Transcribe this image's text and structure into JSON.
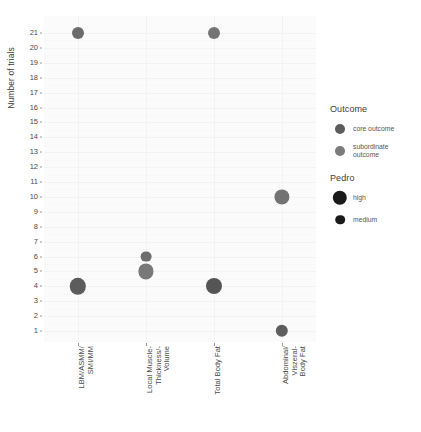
{
  "chart_data": {
    "type": "scatter",
    "title": "",
    "xlabel": "",
    "ylabel": "Number of trials",
    "ylim": [
      1,
      21
    ],
    "grid": true,
    "legend_position": "right",
    "categories": [
      "LBM/ASMM/\nSMI/MM",
      "Local Muscle-\nThickness/-\nVolume",
      "Total Body Fat",
      "Abdominal/\nViszeral-\nBody Fat"
    ],
    "y_ticks": [
      1,
      2,
      3,
      4,
      5,
      6,
      7,
      8,
      9,
      10,
      11,
      12,
      13,
      14,
      15,
      16,
      17,
      18,
      19,
      20,
      21
    ],
    "points": [
      {
        "category": "LBM/ASMM/SMI/MM",
        "category_index": 0,
        "trials": 21,
        "outcome": "core outcome",
        "pedro": "medium",
        "radius": 6.0,
        "color": "#6b6b6b"
      },
      {
        "category": "LBM/ASMM/SMI/MM",
        "category_index": 0,
        "trials": 4,
        "outcome": "core outcome",
        "pedro": "high",
        "radius": 8.2,
        "color": "#5c5c5c"
      },
      {
        "category": "Local Muscle-Thickness/-Volume",
        "category_index": 1,
        "trials": 6,
        "outcome": "core outcome",
        "pedro": "medium",
        "radius": 5.4,
        "color": "#6d6d6d"
      },
      {
        "category": "Local Muscle-Thickness/-Volume",
        "category_index": 1,
        "trials": 5,
        "outcome": "subordinate outcome",
        "pedro": "high",
        "radius": 7.6,
        "color": "#787878"
      },
      {
        "category": "Total Body Fat",
        "category_index": 2,
        "trials": 21,
        "outcome": "subordinate outcome",
        "pedro": "medium",
        "radius": 6.0,
        "color": "#757575"
      },
      {
        "category": "Total Body Fat",
        "category_index": 2,
        "trials": 4,
        "outcome": "core outcome",
        "pedro": "high",
        "radius": 8.0,
        "color": "#555555"
      },
      {
        "category": "Abdominal/Viszeral-Body Fat",
        "category_index": 3,
        "trials": 10,
        "outcome": "subordinate outcome",
        "pedro": "high",
        "radius": 7.6,
        "color": "#737373"
      },
      {
        "category": "Abdominal/Viszeral-Body Fat",
        "category_index": 3,
        "trials": 1,
        "outcome": "core outcome",
        "pedro": "medium",
        "radius": 6.2,
        "color": "#5e5e5e"
      }
    ]
  },
  "axes": {
    "y_title": "Number of trials"
  },
  "legend": {
    "groups": [
      {
        "title": "Outcome",
        "items": [
          {
            "label": "core outcome",
            "color": "#5c5c5c",
            "radius": 5.0
          },
          {
            "label": "subordinate\noutcome",
            "color": "#7b7b7b",
            "radius": 5.0
          }
        ]
      },
      {
        "title": "Pedro",
        "items": [
          {
            "label": "high",
            "color": "#1a1a1a",
            "radius": 7.2
          },
          {
            "label": "medium",
            "color": "#1a1a1a",
            "radius": 4.8
          }
        ]
      }
    ]
  }
}
